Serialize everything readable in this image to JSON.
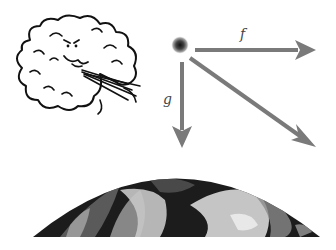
{
  "diagram": {
    "colors": {
      "background": "#ffffff",
      "arrow": "#7a7a7a",
      "ball_core": "#222222",
      "cloud_stroke": "#111111",
      "earth_dark": "#1c1c1c",
      "earth_light": "#d8d8d8"
    },
    "vectors": [
      {
        "name": "f",
        "label": "f",
        "direction": "right",
        "meaning": "wind force"
      },
      {
        "name": "g",
        "label": "g",
        "direction": "down",
        "meaning": "gravity force"
      },
      {
        "name": "resultant",
        "label": "",
        "direction": "down-right",
        "meaning": "resultant force"
      }
    ],
    "icons": [
      "wind-cloud-icon",
      "ball-icon",
      "earth-icon"
    ]
  }
}
